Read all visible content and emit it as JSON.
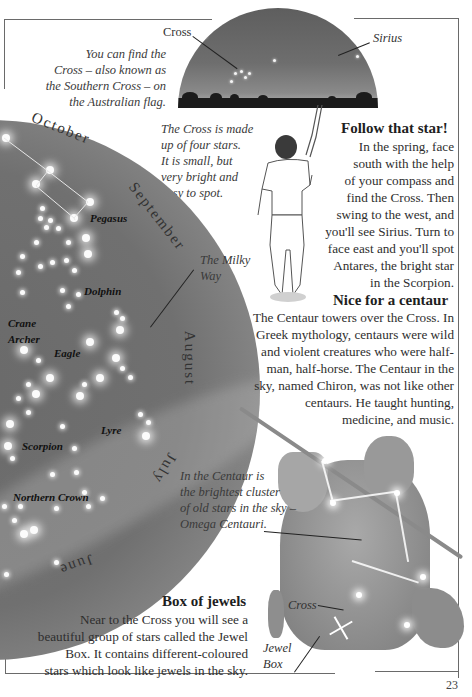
{
  "top_caption": {
    "cross_label": "Cross",
    "lines": [
      "You can find the",
      "Cross – also known as",
      "the Southern Cross – on",
      "the Australian flag."
    ]
  },
  "sky_scene": {
    "cross_label": "Cross",
    "sirius_label": "Sirius"
  },
  "cross_caption": {
    "lines": [
      "The Cross is made",
      "up of four stars.",
      "It is small, but",
      "very bright and",
      "easy to spot."
    ]
  },
  "follow_star": {
    "heading": "Follow that star!",
    "lines": [
      "In the spring, face",
      "south with the help",
      "of your compass and",
      "find the Cross. Then",
      "swing to the west, and",
      "you'll see Sirius. Turn to",
      "face east and you'll spot",
      "Antares, the bright star",
      "in the Scorpion."
    ]
  },
  "star_map": {
    "months": [
      "October",
      "September",
      "August",
      "July",
      "June"
    ],
    "constellations": [
      "Pegasus",
      "Dolphin",
      "Crane",
      "Archer",
      "Eagle",
      "Lyre",
      "Scorpion",
      "Northern Crown"
    ],
    "milky_way_label": [
      "The Milky",
      "Way"
    ]
  },
  "centaur_section": {
    "heading": "Nice for a centaur",
    "lines": [
      "The Centaur towers over the Cross. In",
      "Greek mythology, centaurs were wild",
      "and violent creatures who were half-",
      "man, half-horse. The Centaur in the",
      "sky, named Chiron, was not like other",
      "centaurs. He taught hunting,",
      "medicine, and music."
    ]
  },
  "omega_caption": {
    "lines": [
      "In the Centaur is",
      "the brightest cluster",
      "of old stars in the sky –",
      "Omega Centauri."
    ]
  },
  "jewels_section": {
    "heading": "Box of jewels",
    "lines": [
      "Near to the Cross you will see a",
      "beautiful group of stars called the Jewel",
      "Box. It contains different-coloured",
      "stars which look like jewels in the sky."
    ]
  },
  "centaur_labels": {
    "cross": "Cross",
    "jewel_box": [
      "Jewel",
      "Box"
    ]
  },
  "page_number": "23"
}
